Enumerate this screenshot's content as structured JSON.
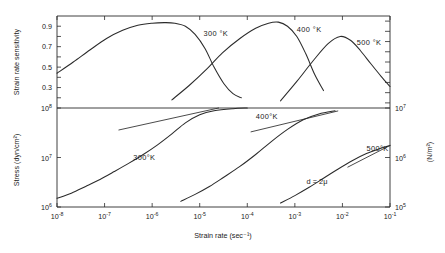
{
  "figure": {
    "annotation_d": "d = 2μ",
    "background": "#ffffff",
    "ink_color": "#2b2b2b"
  },
  "chart_data": [
    {
      "type": "line",
      "panel": "upper",
      "title": "",
      "xlabel": "",
      "ylabel": "Strain rate sensitivity",
      "xscale": "log",
      "xlim": [
        1e-08,
        0.1
      ],
      "ylim": [
        0.1,
        1.0
      ],
      "grid": false,
      "legend_position": "inline-labels",
      "ytick_labels": [
        "0.3",
        "0.5",
        "0.7",
        "0.9"
      ],
      "ytick_values": [
        0.3,
        0.5,
        0.7,
        0.9
      ],
      "series": [
        {
          "name": "300 °K",
          "label": "300 °K",
          "label_x": 1.2e-05,
          "label_y": 0.8,
          "x": [
            1e-08,
            2.2e-08,
            5e-08,
            1.1e-07,
            2.4e-07,
            5e-07,
            1e-06,
            1.8e-06,
            3e-06,
            5e-06,
            8e-06,
            1.3e-05,
            2e-05,
            3.2e-05,
            5e-05,
            7.5e-05
          ],
          "y": [
            0.44,
            0.55,
            0.67,
            0.78,
            0.86,
            0.91,
            0.93,
            0.935,
            0.93,
            0.9,
            0.82,
            0.68,
            0.5,
            0.34,
            0.24,
            0.2
          ]
        },
        {
          "name": "400 °K",
          "label": "400 °K",
          "label_x": 0.0011,
          "label_y": 0.84,
          "x": [
            2.6e-06,
            6e-06,
            1.4e-05,
            3e-05,
            7e-05,
            0.00015,
            0.00028,
            0.00045,
            0.0007,
            0.0011,
            0.0017,
            0.0026,
            0.004
          ],
          "y": [
            0.18,
            0.32,
            0.48,
            0.64,
            0.78,
            0.88,
            0.93,
            0.94,
            0.9,
            0.8,
            0.63,
            0.43,
            0.27
          ]
        },
        {
          "name": "500 °K",
          "label": "500 °K",
          "label_x": 0.02,
          "label_y": 0.72,
          "x": [
            0.0005,
            0.0011,
            0.0024,
            0.005,
            0.009,
            0.015,
            0.024,
            0.04,
            0.065,
            0.1
          ],
          "y": [
            0.17,
            0.36,
            0.56,
            0.73,
            0.8,
            0.76,
            0.66,
            0.53,
            0.41,
            0.31
          ]
        }
      ]
    },
    {
      "type": "line",
      "panel": "lower",
      "title": "",
      "xlabel": "Strain rate (sec⁻¹)",
      "ylabel": "Stress (dyn/cm²)",
      "ylabel_right": "(N/m²)",
      "xscale": "log",
      "yscale": "log",
      "xlim": [
        1e-08,
        0.1
      ],
      "ylim": [
        1000000.0,
        100000000.0
      ],
      "ylim_right": [
        100000.0,
        10000000.0
      ],
      "grid": false,
      "legend_position": "inline-labels",
      "xtick_labels": [
        "10⁻⁸",
        "10⁻⁷",
        "10⁻⁶",
        "10⁻⁵",
        "10⁻⁴",
        "10⁻³",
        "10⁻²",
        "10⁻¹"
      ],
      "xtick_values": [
        1e-08,
        1e-07,
        1e-06,
        1e-05,
        0.0001,
        0.001,
        0.01,
        0.1
      ],
      "ytick_labels": [
        "10⁶",
        "10⁷",
        "10⁸"
      ],
      "ytick_values": [
        1000000.0,
        10000000.0,
        100000000.0
      ],
      "ytick_labels_right": [
        "10⁵",
        "10⁶",
        "10⁷"
      ],
      "ytick_values_right": [
        100000.0,
        1000000.0,
        10000000.0
      ],
      "series": [
        {
          "name": "300 °K",
          "label": "300°K",
          "label_x": 4e-07,
          "label_y": 9000000.0,
          "x": [
            1e-08,
            2e-08,
            4e-08,
            8e-08,
            1.6e-07,
            3.2e-07,
            6.5e-07,
            1.3e-06,
            2.6e-06,
            5e-06,
            1e-05,
            2e-05,
            5e-05,
            0.0001
          ],
          "y": [
            1500000.0,
            1900000.0,
            2600000.0,
            3600000.0,
            5200000.0,
            7600000.0,
            11500000.0,
            18000000.0,
            30000000.0,
            50000000.0,
            73000000.0,
            88000000.0,
            97000000.0,
            100000000.0
          ]
        },
        {
          "name": "400 °K",
          "label": "400°K",
          "label_x": 0.00015,
          "label_y": 61000000.0,
          "x": [
            4e-06,
            8e-06,
            1.6e-05,
            3.2e-05,
            7e-05,
            0.00015,
            0.00032,
            0.0007,
            0.0015,
            0.0032,
            0.007
          ],
          "y": [
            1300000.0,
            1800000.0,
            2600000.0,
            4000000.0,
            6600000.0,
            11500000.0,
            21000000.0,
            37000000.0,
            58000000.0,
            76000000.0,
            88000000.0
          ]
        },
        {
          "name": "500 °K",
          "label": "500°K",
          "label_x": 0.032,
          "label_y": 13500000.0,
          "x": [
            0.0005,
            0.001,
            0.002,
            0.004,
            0.008,
            0.016,
            0.032,
            0.06,
            0.1
          ],
          "y": [
            1200000.0,
            1700000.0,
            2500000.0,
            3800000.0,
            5800000.0,
            8600000.0,
            12000000.0,
            15000000.0,
            17500000.0
          ]
        }
      ],
      "tangent_segments": [
        {
          "name": "tangent-300",
          "x": [
            2e-07,
            2.5e-05
          ],
          "y": [
            36000000.0,
            100000000.0
          ]
        },
        {
          "name": "tangent-400",
          "x": [
            0.00012,
            0.008
          ],
          "y": [
            33000000.0,
            87000000.0
          ]
        },
        {
          "name": "tangent-500",
          "x": [
            0.013,
            0.1
          ],
          "y": [
            6400000.0,
            17500000.0
          ]
        }
      ]
    }
  ]
}
